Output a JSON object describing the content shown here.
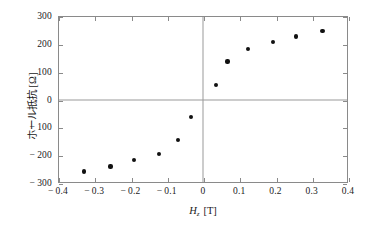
{
  "chart_data": {
    "type": "scatter",
    "title": "",
    "xlabel": "H_z [T]",
    "ylabel": "ホール抵抗 [Ω]",
    "xlabel_symbol": "H",
    "xlabel_subscript": "z",
    "xlabel_unit": "[T]",
    "ylabel_text": "ホール抵抗",
    "ylabel_unit": "[Ω]",
    "xlim": [
      -0.4,
      0.4
    ],
    "ylim": [
      -300,
      300
    ],
    "xticks": [
      "-0.4",
      "-0.3",
      "-0.2",
      "-0.1",
      "0",
      "0.1",
      "0.2",
      "0.3",
      "0.4"
    ],
    "xtick_values": [
      -0.4,
      -0.3,
      -0.2,
      -0.1,
      0,
      0.1,
      0.2,
      0.3,
      0.4
    ],
    "yticks": [
      "300",
      "200",
      "100",
      "0",
      "-100",
      "-200",
      "-300"
    ],
    "ytick_values": [
      300,
      200,
      100,
      0,
      -100,
      -200,
      -300
    ],
    "grid": false,
    "legend": null,
    "marker": "filled-circle",
    "marker_color": "#111111",
    "axis_color": "#8a8a8a",
    "zero_lines": true,
    "x": [
      -0.33,
      -0.258,
      -0.193,
      -0.125,
      -0.072,
      -0.035,
      0.032,
      0.065,
      0.122,
      0.19,
      0.253,
      0.327
    ],
    "y": [
      -255,
      -237,
      -215,
      -192,
      -142,
      -58,
      57,
      140,
      186,
      209,
      230,
      250
    ],
    "points": [
      {
        "x": -0.33,
        "y": -255
      },
      {
        "x": -0.258,
        "y": -237
      },
      {
        "x": -0.193,
        "y": -215
      },
      {
        "x": -0.125,
        "y": -192
      },
      {
        "x": -0.072,
        "y": -142
      },
      {
        "x": -0.035,
        "y": -58
      },
      {
        "x": 0.032,
        "y": 57
      },
      {
        "x": 0.065,
        "y": 140
      },
      {
        "x": 0.122,
        "y": 186
      },
      {
        "x": 0.19,
        "y": 209
      },
      {
        "x": 0.253,
        "y": 230
      },
      {
        "x": 0.327,
        "y": 250
      }
    ]
  }
}
